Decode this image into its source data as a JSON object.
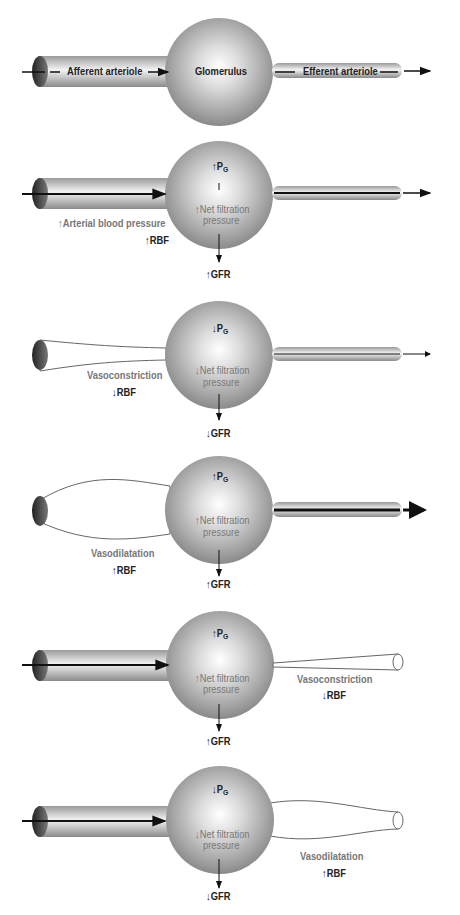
{
  "diagram": {
    "title_panel": {
      "afferent_label": "Afferent arteriole",
      "glomerulus_label": "Glomerulus",
      "efferent_label": "Efferent arteriole"
    },
    "panels": [
      {
        "condition": "↑Arterial blood pressure",
        "pg": "↑P",
        "pg_sub": "G",
        "nfp1": "↑Net filtration",
        "nfp2": "pressure",
        "rbf": "↑RBF",
        "gfr": "↑GFR"
      },
      {
        "condition": "Vasoconstriction",
        "pg": "↓P",
        "pg_sub": "G",
        "nfp1": "↓Net filtration",
        "nfp2": "pressure",
        "rbf": "↓RBF",
        "gfr": "↓GFR"
      },
      {
        "condition": "Vasodilatation",
        "pg": "↑P",
        "pg_sub": "G",
        "nfp1": "↑Net filtration",
        "nfp2": "pressure",
        "rbf": "↑RBF",
        "gfr": "↑GFR"
      },
      {
        "condition": "Vasoconstriction",
        "pg": "↑P",
        "pg_sub": "G",
        "nfp1": "↑Net filtration",
        "nfp2": "pressure",
        "rbf": "↓RBF",
        "gfr": "↑GFR"
      },
      {
        "condition": "Vasodilatation",
        "pg": "↓P",
        "pg_sub": "G",
        "nfp1": "↓Net filtration",
        "nfp2": "pressure",
        "rbf": "↑RBF",
        "gfr": "↓GFR"
      }
    ],
    "arrow_down": "↓"
  }
}
